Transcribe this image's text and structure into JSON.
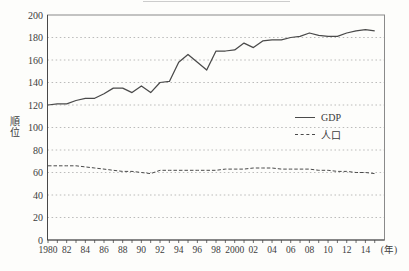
{
  "figure": {
    "y_axis_title": "順位",
    "x_axis_unit": "(年)"
  },
  "legend": {
    "items": [
      {
        "label": "GDP",
        "style": "solid"
      },
      {
        "label": "人口",
        "style": "dashed"
      }
    ]
  },
  "colors": {
    "line": "#4a4a4a",
    "grid": "#aaaaaa",
    "axis": "#8a8a8a",
    "axis_dark": "#484848",
    "text": "#3c3c3c"
  },
  "chart_data": {
    "type": "line",
    "title": "",
    "ylabel": "順位",
    "xlabel_unit": "(年)",
    "ylim": [
      0,
      200
    ],
    "grid": "horizontal-dotted",
    "legend_position": "inside-right",
    "y_ticks": [
      0,
      20,
      40,
      60,
      80,
      100,
      120,
      140,
      160,
      180,
      200
    ],
    "x": [
      1980,
      1981,
      1982,
      1983,
      1984,
      1985,
      1986,
      1987,
      1988,
      1989,
      1990,
      1991,
      1992,
      1993,
      1994,
      1995,
      1996,
      1997,
      1998,
      1999,
      2000,
      2001,
      2002,
      2003,
      2004,
      2005,
      2006,
      2007,
      2008,
      2009,
      2010,
      2011,
      2012,
      2013,
      2014,
      2015
    ],
    "x_tick_labels": [
      {
        "year": 1980,
        "label": "1980"
      },
      {
        "year": 1982,
        "label": "82"
      },
      {
        "year": 1984,
        "label": "84"
      },
      {
        "year": 1986,
        "label": "86"
      },
      {
        "year": 1988,
        "label": "88"
      },
      {
        "year": 1990,
        "label": "90"
      },
      {
        "year": 1992,
        "label": "92"
      },
      {
        "year": 1994,
        "label": "94"
      },
      {
        "year": 1996,
        "label": "96"
      },
      {
        "year": 1998,
        "label": "98"
      },
      {
        "year": 2000,
        "label": "2000"
      },
      {
        "year": 2002,
        "label": "02"
      },
      {
        "year": 2004,
        "label": "04"
      },
      {
        "year": 2006,
        "label": "06"
      },
      {
        "year": 2008,
        "label": "08"
      },
      {
        "year": 2010,
        "label": "10"
      },
      {
        "year": 2012,
        "label": "12"
      },
      {
        "year": 2014,
        "label": "14"
      }
    ],
    "series": [
      {
        "name": "GDP",
        "style": "solid",
        "values": [
          120,
          121,
          121,
          124,
          126,
          126,
          130,
          135,
          135,
          131,
          137,
          131,
          140,
          141,
          158,
          165,
          158,
          151,
          168,
          168,
          169,
          175,
          171,
          177,
          178,
          178,
          180,
          181,
          184,
          182,
          181,
          181,
          184,
          186,
          187,
          186
        ]
      },
      {
        "name": "人口",
        "style": "dashed",
        "values": [
          66,
          66,
          66,
          66,
          65,
          64,
          63,
          62,
          61,
          61,
          60,
          59,
          62,
          62,
          62,
          62,
          62,
          62,
          62,
          63,
          63,
          63,
          64,
          64,
          64,
          63,
          63,
          63,
          63,
          62,
          62,
          61,
          61,
          60,
          60,
          59
        ]
      }
    ]
  }
}
